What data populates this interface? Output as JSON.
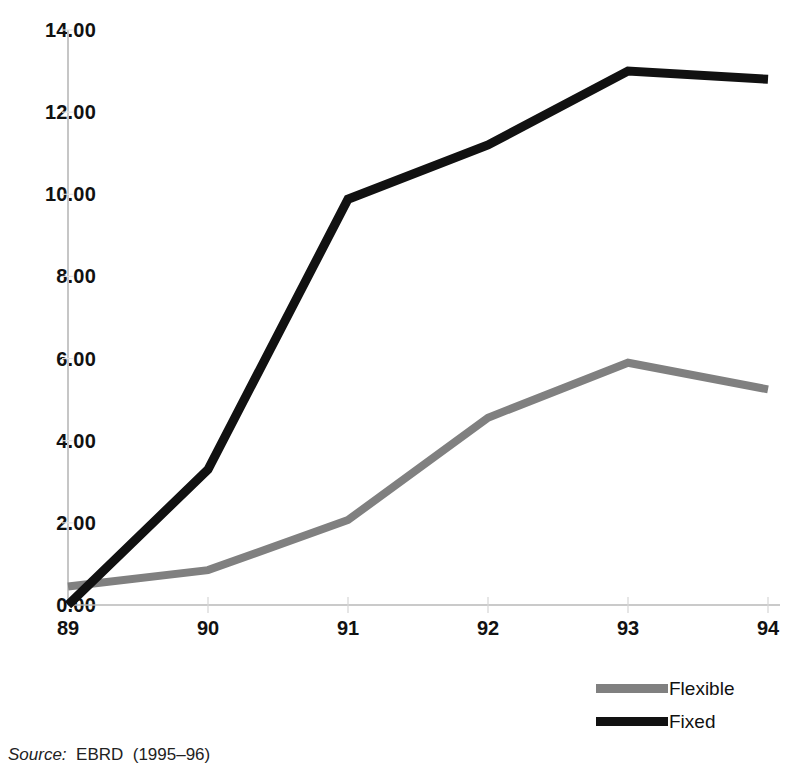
{
  "chart_data": {
    "type": "line",
    "title": "",
    "subtitle": "",
    "xlabel": "",
    "ylabel": "",
    "x": [
      "89",
      "90",
      "91",
      "92",
      "93",
      "94"
    ],
    "categories": [
      "89",
      "90",
      "91",
      "92",
      "93",
      "94"
    ],
    "series": [
      {
        "name": "Flexible",
        "color": "#808080",
        "values": [
          0.45,
          0.85,
          2.07,
          4.56,
          5.9,
          5.25
        ]
      },
      {
        "name": "Fixed",
        "color": "#111111",
        "values": [
          0.0,
          3.3,
          9.88,
          11.2,
          13.0,
          12.8
        ]
      }
    ],
    "ylim": [
      0,
      14
    ],
    "xlim": [
      "89",
      "94"
    ],
    "ytick_labels": [
      "0.00",
      "2.00",
      "4.00",
      "6.00",
      "8.00",
      "10.00",
      "12.00",
      "14.00"
    ],
    "ytick_values": [
      0,
      2,
      4,
      6,
      8,
      10,
      12,
      14
    ],
    "xtick_labels": [
      "89",
      "90",
      "91",
      "92",
      "93",
      "94"
    ],
    "grid": false,
    "legend_position": "bottom-right",
    "axis_color": "#b8b8b8"
  },
  "legend": {
    "items": [
      {
        "label": "Flexible",
        "color": "#808080"
      },
      {
        "label": "Fixed",
        "color": "#111111"
      }
    ]
  },
  "source_note": {
    "label": "Source:",
    "text": "  EBRD  (1995–96)"
  }
}
